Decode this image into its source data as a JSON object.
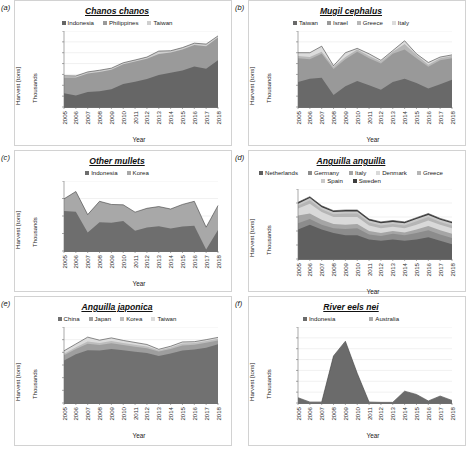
{
  "figure": {
    "background": "#ffffff",
    "panel_ids": [
      "(a)",
      "(b)",
      "(c)",
      "(d)",
      "(e)",
      "(f)"
    ]
  },
  "common": {
    "ylabel": "Harvest [tons]",
    "ylabel_secondary": "Thousands",
    "xlabel": "Year",
    "years": [
      "2005",
      "2006",
      "2007",
      "2008",
      "2009",
      "2010",
      "2011",
      "2012",
      "2013",
      "2014",
      "2015",
      "2016",
      "2017",
      "2018"
    ]
  },
  "chart_data": [
    {
      "panel": "(a)",
      "type": "area",
      "stacked": true,
      "title": "Chanos chanos",
      "xlabel": "Year",
      "ylabel": "Harvest [tons]",
      "ylabel_secondary": "Thousands",
      "x": [
        "2005",
        "2006",
        "2007",
        "2008",
        "2009",
        "2010",
        "2011",
        "2012",
        "2013",
        "2014",
        "2015",
        "2016",
        "2017",
        "2018"
      ],
      "ylim": [
        0,
        1400
      ],
      "yticks": [
        0,
        200,
        400,
        600,
        800,
        1000,
        1200,
        1400
      ],
      "ytick_labels": [
        "0",
        "200",
        "400",
        "600",
        "800",
        "1,000",
        "1,200",
        "1,400"
      ],
      "grid": true,
      "legend_position": "top-center",
      "series": [
        {
          "name": "Indonesia",
          "color": "#666666",
          "values": [
            254,
            212,
            277,
            291,
            328,
            422,
            467,
            518,
            590,
            631,
            672,
            748,
            706,
            861
          ]
        },
        {
          "name": "Philippines",
          "color": "#9a9a9a",
          "values": [
            289,
            332,
            339,
            355,
            357,
            364,
            370,
            372,
            388,
            374,
            386,
            394,
            415,
            421
          ]
        },
        {
          "name": "Taiwan",
          "color": "#cfcfcf",
          "values": [
            32,
            28,
            30,
            31,
            30,
            29,
            29,
            30,
            52,
            31,
            36,
            34,
            38,
            28
          ]
        }
      ]
    },
    {
      "panel": "(b)",
      "type": "area",
      "stacked": true,
      "title": "Mugil cephalus",
      "xlabel": "Year",
      "ylabel": "Harvest [tons]",
      "ylabel_secondary": "Thousands",
      "x": [
        "2005",
        "2006",
        "2007",
        "2008",
        "2009",
        "2010",
        "2011",
        "2012",
        "2013",
        "2014",
        "2015",
        "2016",
        "2017",
        "2018"
      ],
      "ylim": [
        0,
        7
      ],
      "yticks": [
        0,
        1,
        2,
        3,
        4,
        5,
        6,
        7
      ],
      "ytick_labels": [
        "0",
        "1",
        "2",
        "3",
        "4",
        "5",
        "6",
        "7"
      ],
      "grid": true,
      "legend_position": "top-center",
      "series": [
        {
          "name": "Taiwan",
          "color": "#696969",
          "values": [
            2.3,
            2.6,
            2.7,
            1.1,
            1.9,
            2.4,
            2.0,
            1.6,
            2.3,
            2.6,
            2.2,
            1.7,
            2.1,
            2.5
          ]
        },
        {
          "name": "Israel",
          "color": "#999999",
          "values": [
            2.2,
            1.8,
            2.2,
            2.4,
            2.5,
            2.7,
            2.5,
            2.4,
            2.6,
            2.7,
            2.3,
            2.0,
            2.2,
            2.0
          ]
        },
        {
          "name": "Greece",
          "color": "#b7b7b7",
          "values": [
            0.2,
            0.2,
            0.2,
            0.2,
            0.2,
            0.2,
            0.2,
            0.2,
            0.2,
            0.5,
            0.3,
            0.2,
            0.2,
            0.2
          ]
        },
        {
          "name": "Italy",
          "color": "#dcdcdc",
          "values": [
            0.3,
            0.4,
            0.5,
            0.1,
            0.4,
            0.1,
            0.2,
            0.1,
            0.1,
            0.3,
            0.1,
            0.2,
            0.1,
            0.1
          ]
        }
      ]
    },
    {
      "panel": "(c)",
      "type": "area",
      "stacked": true,
      "title": "Other mullets",
      "xlabel": "Year",
      "ylabel": "Harvest [tons]",
      "ylabel_secondary": "Thousands",
      "x": [
        "2005",
        "2006",
        "2007",
        "2008",
        "2009",
        "2010",
        "2011",
        "2012",
        "2013",
        "2014",
        "2015",
        "2016",
        "2017",
        "2018"
      ],
      "ylim": [
        0,
        20
      ],
      "yticks": [
        0,
        5,
        10,
        15,
        20
      ],
      "ytick_labels": [
        "0",
        "5",
        "10",
        "15",
        "20"
      ],
      "grid": true,
      "legend_position": "top-center",
      "series": [
        {
          "name": "Indonesia",
          "color": "#6e6e6e",
          "values": [
            11.4,
            11.2,
            5.3,
            8.2,
            8.1,
            8.6,
            5.8,
            6.7,
            7.1,
            6.4,
            7.0,
            7.2,
            0.4,
            6.0
          ]
        },
        {
          "name": "Korea",
          "color": "#a8a8a8",
          "values": [
            3.5,
            5.8,
            5.1,
            6.0,
            5.2,
            4.6,
            5.3,
            5.5,
            5.6,
            5.6,
            6.3,
            7.0,
            6.4,
            7.0
          ]
        }
      ]
    },
    {
      "panel": "(d)",
      "type": "area",
      "stacked": true,
      "title": "Anguilla anguilla",
      "xlabel": "Year",
      "ylabel": "Harvest [tons]",
      "ylabel_secondary": "Thousands",
      "x": [
        "2005",
        "2006",
        "2007",
        "2008",
        "2009",
        "2010",
        "2011",
        "2012",
        "2013",
        "2014",
        "2015",
        "2016",
        "2017",
        "2018"
      ],
      "ylim": [
        0,
        10
      ],
      "yticks": [
        0,
        2,
        4,
        6,
        8,
        10
      ],
      "ytick_labels": [
        "0",
        "2",
        "4",
        "6",
        "8",
        "10"
      ],
      "grid": true,
      "legend_position": "top-center",
      "series": [
        {
          "name": "Netherlands",
          "color": "#5f5f5f",
          "values": [
            4.2,
            4.9,
            4.2,
            3.7,
            3.4,
            3.4,
            2.8,
            2.6,
            2.8,
            2.6,
            2.8,
            3.1,
            2.6,
            2.1
          ]
        },
        {
          "name": "Germany",
          "color": "#8c8c8c",
          "values": [
            0.9,
            0.8,
            0.7,
            0.7,
            0.9,
            1.0,
            0.7,
            0.7,
            0.8,
            0.8,
            0.9,
            1.0,
            0.9,
            0.9
          ]
        },
        {
          "name": "Italy",
          "color": "#a5a5a5",
          "values": [
            1.1,
            0.8,
            0.7,
            0.6,
            0.6,
            0.6,
            0.5,
            0.4,
            0.4,
            0.4,
            0.5,
            0.6,
            0.6,
            0.6
          ]
        },
        {
          "name": "Denmark",
          "color": "#d9d9d9",
          "values": [
            1.0,
            1.4,
            1.1,
            1.0,
            1.1,
            1.0,
            0.8,
            0.7,
            0.6,
            0.6,
            0.7,
            0.8,
            0.8,
            0.8
          ]
        },
        {
          "name": "Greece",
          "color": "#b5b5b5",
          "values": [
            0.4,
            0.5,
            0.4,
            0.4,
            0.5,
            0.5,
            0.4,
            0.4,
            0.4,
            0.4,
            0.5,
            0.5,
            0.4,
            0.4
          ]
        },
        {
          "name": "Spain",
          "color": "#c9c9c9",
          "values": [
            0.3,
            0.3,
            0.3,
            0.3,
            0.3,
            0.3,
            0.3,
            0.3,
            0.3,
            0.3,
            0.3,
            0.3,
            0.3,
            0.3
          ]
        },
        {
          "name": "Sweden",
          "color": "#3d3d3d",
          "values": [
            0.2,
            0.2,
            0.2,
            0.2,
            0.2,
            0.2,
            0.2,
            0.2,
            0.2,
            0.2,
            0.2,
            0.2,
            0.2,
            0.2
          ]
        }
      ]
    },
    {
      "panel": "(e)",
      "type": "area",
      "stacked": true,
      "title": "Anguilla japonica",
      "xlabel": "Year",
      "ylabel": "Harvest [tons]",
      "ylabel_secondary": "Thousands",
      "x": [
        "2005",
        "2006",
        "2007",
        "2008",
        "2009",
        "2010",
        "2011",
        "2012",
        "2013",
        "2014",
        "2015",
        "2016",
        "2017",
        "2018"
      ],
      "ylim": [
        0,
        300
      ],
      "yticks": [
        0,
        50,
        100,
        150,
        200,
        250,
        300
      ],
      "ytick_labels": [
        "0",
        "50",
        "100",
        "150",
        "200",
        "250",
        "300"
      ],
      "grid": true,
      "legend_position": "top-center",
      "series": [
        {
          "name": "China",
          "color": "#717171",
          "values": [
            168,
            192,
            208,
            207,
            213,
            208,
            202,
            197,
            186,
            195,
            207,
            211,
            218,
            232
          ]
        },
        {
          "name": "Japan",
          "color": "#9e9e9e",
          "values": [
            20,
            21,
            26,
            22,
            23,
            21,
            20,
            19,
            17,
            18,
            20,
            19,
            20,
            15
          ]
        },
        {
          "name": "Korea",
          "color": "#bdbdbd",
          "values": [
            6,
            7,
            9,
            8,
            9,
            8,
            8,
            7,
            5,
            6,
            8,
            7,
            7,
            7
          ]
        },
        {
          "name": "Taiwan",
          "color": "#dcdcdc",
          "values": [
            12,
            13,
            17,
            11,
            12,
            10,
            9,
            8,
            4,
            5,
            6,
            5,
            5,
            5
          ]
        }
      ]
    },
    {
      "panel": "(f)",
      "type": "area",
      "stacked": true,
      "title": "River eels nei",
      "xlabel": "Year",
      "ylabel": "Harvest [tons]",
      "ylabel_secondary": "Thousands",
      "x": [
        "2005",
        "2006",
        "2007",
        "2008",
        "2009",
        "2010",
        "2011",
        "2012",
        "2013",
        "2014",
        "2015",
        "2016",
        "2017",
        "2018"
      ],
      "ylim": [
        0,
        7
      ],
      "yticks": [
        0,
        1,
        2,
        3,
        4,
        5,
        6,
        7
      ],
      "ytick_labels": [
        "0",
        "1",
        "2",
        "3",
        "4",
        "5",
        "6",
        "7"
      ],
      "grid": true,
      "legend_position": "top-center",
      "series": [
        {
          "name": "Indonesia",
          "color": "#6b6b6b",
          "values": [
            0.45,
            0.05,
            0.05,
            4.3,
            5.65,
            2.7,
            0.05,
            0.02,
            0.02,
            1.05,
            0.75,
            0.15,
            0.6,
            0.2
          ]
        },
        {
          "name": "Australia",
          "color": "#a9a9a9",
          "values": [
            0.04,
            0.04,
            0.04,
            0.04,
            0.04,
            0.04,
            0.04,
            0.04,
            0.04,
            0.04,
            0.04,
            0.04,
            0.04,
            0.04
          ]
        }
      ]
    }
  ]
}
